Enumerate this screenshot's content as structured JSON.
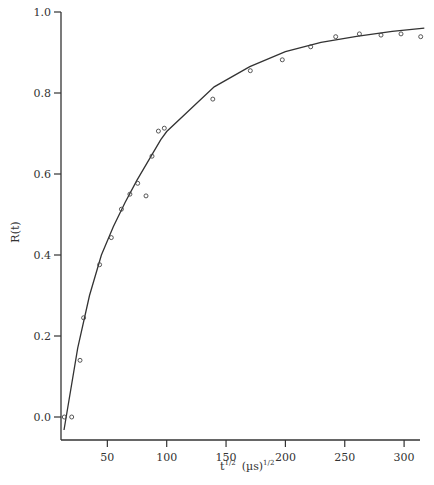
{
  "chart_data": {
    "type": "scatter",
    "title": "",
    "xlabel": "t^1/2 (µs)^1/2",
    "xlabel_parts": {
      "base": "t",
      "sup1": "1/2",
      "unit": "(µs)",
      "sup2": "1/2"
    },
    "ylabel": "R(t)",
    "xlim": [
      5,
      317
    ],
    "ylim": [
      -0.06,
      1.0
    ],
    "xticks": [
      50,
      100,
      150,
      200,
      250,
      300
    ],
    "xtick_labels": [
      "50",
      "100",
      "150",
      "200",
      "250",
      "300"
    ],
    "yticks": [
      0.0,
      0.2,
      0.4,
      0.6,
      0.8,
      1.0
    ],
    "ytick_labels": [
      "0.0",
      "0.2",
      "0.4",
      "0.6",
      "0.8",
      "1.0"
    ],
    "grid": false,
    "legend": null,
    "series": [
      {
        "name": "data",
        "kind": "scatter",
        "marker": "open-circle",
        "x": [
          13.7,
          20,
          27,
          30,
          43.5,
          53.3,
          61.8,
          69,
          75.6,
          82.6,
          87.6,
          93,
          98,
          138.8,
          170.4,
          197.4,
          221.3,
          242.4,
          262.3,
          280.5,
          297.4,
          314
        ],
        "y": [
          0.0,
          0.0,
          0.14,
          0.245,
          0.376,
          0.443,
          0.513,
          0.55,
          0.577,
          0.546,
          0.644,
          0.706,
          0.713,
          0.785,
          0.855,
          0.882,
          0.914,
          0.939,
          0.946,
          0.943,
          0.946,
          0.939
        ]
      },
      {
        "name": "fit",
        "kind": "line",
        "x": [
          13.5,
          25,
          35,
          45,
          55,
          65,
          75,
          85,
          95,
          100,
          140,
          170,
          200,
          230,
          260,
          290,
          317
        ],
        "y": [
          -0.032,
          0.17,
          0.3,
          0.4,
          0.47,
          0.53,
          0.585,
          0.635,
          0.685,
          0.705,
          0.815,
          0.865,
          0.902,
          0.925,
          0.94,
          0.952,
          0.96
        ]
      }
    ]
  }
}
